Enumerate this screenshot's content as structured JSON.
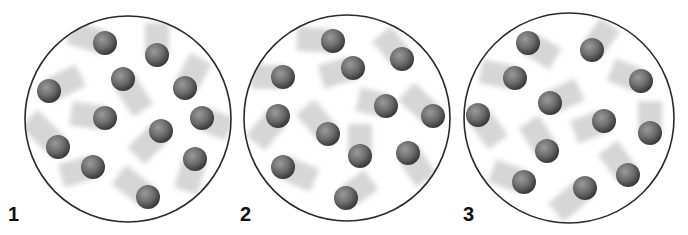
{
  "figure": {
    "panels": [
      {
        "label": "1",
        "center": [
          128,
          119
        ],
        "radius": 103,
        "label_pos": [
          8,
          204
        ],
        "particles": [
          {
            "x": 105,
            "y": 43,
            "tx": -32,
            "ty": -10
          },
          {
            "x": 157,
            "y": 55,
            "tx": 0,
            "ty": -28
          },
          {
            "x": 49,
            "y": 91,
            "tx": 28,
            "ty": -14
          },
          {
            "x": 123,
            "y": 79,
            "tx": 18,
            "ty": 28
          },
          {
            "x": 185,
            "y": 88,
            "tx": 14,
            "ty": -26
          },
          {
            "x": 105,
            "y": 118,
            "tx": -30,
            "ty": -4
          },
          {
            "x": 202,
            "y": 118,
            "tx": 24,
            "ty": 10
          },
          {
            "x": 161,
            "y": 131,
            "tx": -22,
            "ty": 22
          },
          {
            "x": 58,
            "y": 147,
            "tx": -26,
            "ty": -26
          },
          {
            "x": 93,
            "y": 167,
            "tx": -28,
            "ty": 8
          },
          {
            "x": 195,
            "y": 159,
            "tx": -8,
            "ty": 28
          },
          {
            "x": 148,
            "y": 197,
            "tx": -26,
            "ty": -20
          }
        ]
      },
      {
        "label": "2",
        "center": [
          347,
          118
        ],
        "radius": 103,
        "label_pos": [
          240,
          204
        ],
        "particles": [
          {
            "x": 333,
            "y": 41,
            "tx": -32,
            "ty": -2
          },
          {
            "x": 402,
            "y": 59,
            "tx": -18,
            "ty": -22
          },
          {
            "x": 283,
            "y": 77,
            "tx": -28,
            "ty": 0
          },
          {
            "x": 353,
            "y": 68,
            "tx": -28,
            "ty": 8
          },
          {
            "x": 386,
            "y": 106,
            "tx": -24,
            "ty": -6
          },
          {
            "x": 278,
            "y": 116,
            "tx": -20,
            "ty": 24
          },
          {
            "x": 433,
            "y": 116,
            "tx": -24,
            "ty": -22
          },
          {
            "x": 328,
            "y": 134,
            "tx": -20,
            "ty": -24
          },
          {
            "x": 360,
            "y": 156,
            "tx": 0,
            "ty": -28
          },
          {
            "x": 408,
            "y": 153,
            "tx": 16,
            "ty": 24
          },
          {
            "x": 283,
            "y": 167,
            "tx": 28,
            "ty": 12
          },
          {
            "x": 346,
            "y": 198,
            "tx": 22,
            "ty": -16
          }
        ]
      },
      {
        "label": "3",
        "center": [
          569,
          118
        ],
        "radius": 105,
        "label_pos": [
          463,
          204
        ],
        "particles": [
          {
            "x": 528,
            "y": 43,
            "tx": 24,
            "ty": 14
          },
          {
            "x": 592,
            "y": 50,
            "tx": 16,
            "ty": -22
          },
          {
            "x": 515,
            "y": 78,
            "tx": -30,
            "ty": -6
          },
          {
            "x": 641,
            "y": 81,
            "tx": -26,
            "ty": -10
          },
          {
            "x": 550,
            "y": 103,
            "tx": 26,
            "ty": -12
          },
          {
            "x": 478,
            "y": 115,
            "tx": 18,
            "ty": 24
          },
          {
            "x": 604,
            "y": 121,
            "tx": -26,
            "ty": 10
          },
          {
            "x": 650,
            "y": 133,
            "tx": 0,
            "ty": -28
          },
          {
            "x": 547,
            "y": 151,
            "tx": -16,
            "ty": -26
          },
          {
            "x": 524,
            "y": 182,
            "tx": -28,
            "ty": -10
          },
          {
            "x": 585,
            "y": 188,
            "tx": -26,
            "ty": 22
          },
          {
            "x": 628,
            "y": 175,
            "tx": -18,
            "ty": -24
          }
        ]
      }
    ],
    "colors": {
      "background": "#ffffff",
      "container_stroke": "#2a2a2a",
      "particle_light": "#9a9a9a",
      "particle_mid": "#6e6e6e",
      "particle_dark": "#3a3a3a",
      "trail": "#c8c8c8",
      "label": "#111111"
    },
    "particle_radius": 12
  }
}
